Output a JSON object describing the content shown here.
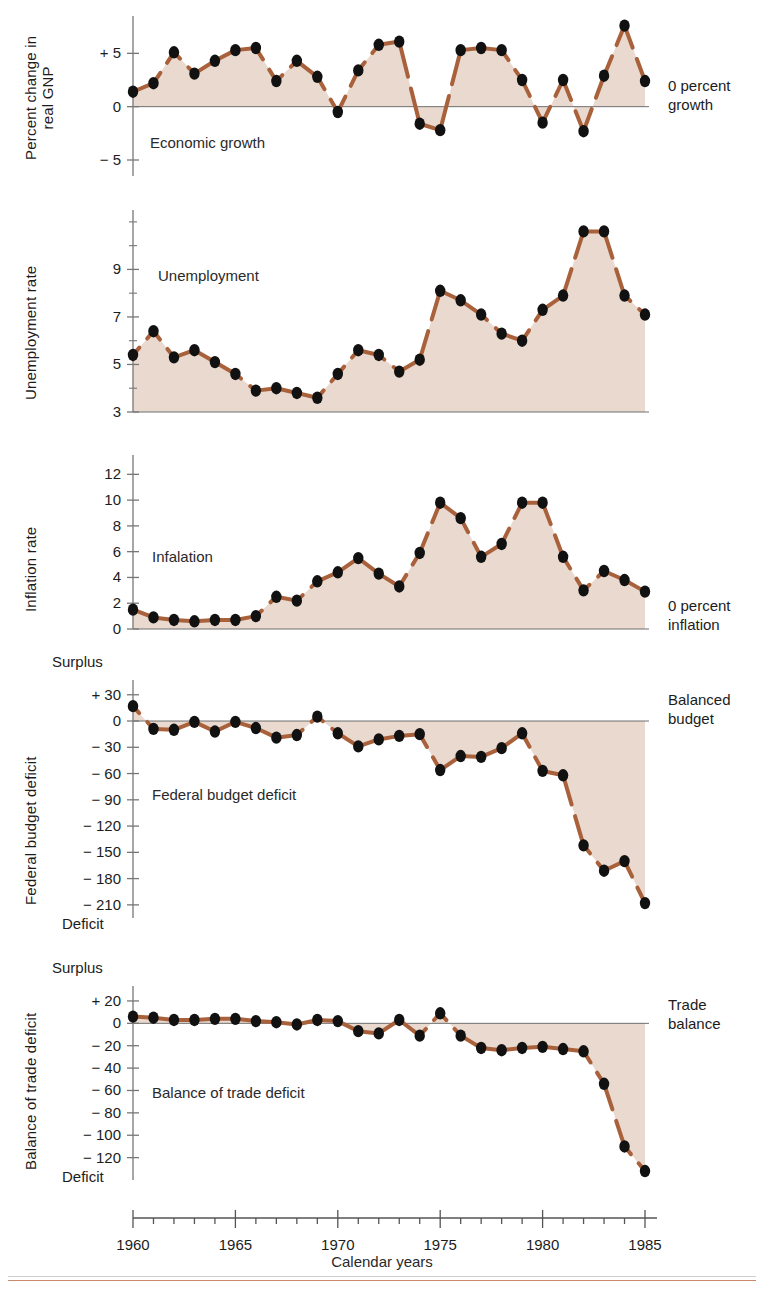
{
  "figure": {
    "x_axis_title": "Calendar years",
    "x_ticks": [
      1960,
      1965,
      1970,
      1975,
      1980,
      1985
    ],
    "x_min": 1960,
    "x_max": 1985,
    "series_color": "#a9613c",
    "fill_color": "#e8d7cb",
    "marker_color": "#111111",
    "axis_color": "#777777",
    "rule_color": "#c98a6b"
  },
  "chart_data": [
    {
      "type": "line",
      "name": "economic-growth",
      "title": "Economic growth",
      "ylabel": "Percent change in\nreal GNP",
      "xlabel": "",
      "annotation": "0 percent\ngrowth",
      "ylim": [
        -6.5,
        8.5
      ],
      "yticks": [
        -5,
        0,
        5
      ],
      "ytick_labels": [
        "− 5",
        "0",
        "+ 5"
      ],
      "grid": false,
      "baseline": 0,
      "x": [
        1960,
        1961,
        1962,
        1963,
        1964,
        1965,
        1966,
        1967,
        1968,
        1969,
        1970,
        1971,
        1972,
        1973,
        1974,
        1975,
        1976,
        1977,
        1978,
        1979,
        1980,
        1981,
        1982,
        1983,
        1984,
        1985
      ],
      "values": [
        1.4,
        2.2,
        5.1,
        3.1,
        4.3,
        5.3,
        5.5,
        2.4,
        4.3,
        2.8,
        -0.5,
        3.4,
        5.8,
        6.1,
        -1.6,
        -2.2,
        5.3,
        5.5,
        5.3,
        2.5,
        -1.5,
        2.5,
        -2.3,
        2.9,
        7.6,
        2.4
      ]
    },
    {
      "type": "line",
      "name": "unemployment",
      "title": "Unemployment",
      "ylabel": "Unemployment rate",
      "xlabel": "",
      "annotation": "",
      "ylim": [
        3,
        11.5
      ],
      "yticks": [
        3,
        5,
        7,
        9
      ],
      "ytick_labels": [
        "3",
        "5",
        "7",
        "9"
      ],
      "grid": false,
      "baseline": 3,
      "x": [
        1960,
        1961,
        1962,
        1963,
        1964,
        1965,
        1966,
        1967,
        1968,
        1969,
        1970,
        1971,
        1972,
        1973,
        1974,
        1975,
        1976,
        1977,
        1978,
        1979,
        1980,
        1981,
        1982,
        1983,
        1984,
        1985
      ],
      "values": [
        5.4,
        6.4,
        5.3,
        5.6,
        5.1,
        4.6,
        3.9,
        4.0,
        3.8,
        3.6,
        4.6,
        5.6,
        5.4,
        4.7,
        5.2,
        8.1,
        7.7,
        7.1,
        6.3,
        6.0,
        7.3,
        7.9,
        10.6,
        10.6,
        7.9,
        7.1
      ]
    },
    {
      "type": "line",
      "name": "inflation",
      "title": "Infalation",
      "ylabel": "Inflation rate",
      "xlabel": "",
      "annotation": "0 percent\ninflation",
      "ylim": [
        0,
        13.5
      ],
      "yticks": [
        0,
        2,
        4,
        6,
        8,
        10,
        12
      ],
      "ytick_labels": [
        "0",
        "2",
        "4",
        "6",
        "8",
        "10",
        "12"
      ],
      "grid": false,
      "baseline": 0,
      "x": [
        1960,
        1961,
        1962,
        1963,
        1964,
        1965,
        1966,
        1967,
        1968,
        1969,
        1970,
        1971,
        1972,
        1973,
        1974,
        1975,
        1976,
        1977,
        1978,
        1979,
        1980,
        1981,
        1982,
        1983,
        1984,
        1985
      ],
      "values": [
        1.5,
        0.9,
        0.7,
        0.6,
        0.7,
        0.7,
        1.0,
        2.5,
        2.2,
        3.7,
        4.4,
        5.5,
        4.3,
        3.3,
        5.9,
        9.8,
        8.6,
        5.6,
        6.6,
        9.8,
        9.8,
        5.6,
        3.0,
        4.5,
        3.8,
        2.9
      ]
    },
    {
      "type": "line",
      "name": "federal-budget-deficit",
      "title": "Federal budget deficit",
      "ylabel": "Federal budget deficit",
      "xlabel": "",
      "annotation": "Balanced\nbudget",
      "axis_top_label": "Surplus",
      "axis_bottom_label": "Deficit",
      "ylim": [
        -225,
        40
      ],
      "yticks": [
        30,
        0,
        -30,
        -60,
        -90,
        -120,
        -150,
        -180,
        -210
      ],
      "ytick_labels": [
        "+ 30",
        "0",
        "− 30",
        "− 60",
        "− 90",
        "− 120",
        "− 150",
        "− 180",
        "− 210"
      ],
      "grid": false,
      "baseline": 0,
      "x": [
        1960,
        1961,
        1962,
        1963,
        1964,
        1965,
        1966,
        1967,
        1968,
        1969,
        1970,
        1971,
        1972,
        1973,
        1974,
        1975,
        1976,
        1977,
        1978,
        1979,
        1980,
        1981,
        1982,
        1983,
        1984,
        1985
      ],
      "values": [
        17,
        -9,
        -10,
        -1,
        -12,
        -1,
        -8,
        -19,
        -16,
        5,
        -14,
        -29,
        -21,
        -17,
        -15,
        -56,
        -40,
        -41,
        -31,
        -14,
        -57,
        -62,
        -142,
        -171,
        -160,
        -208
      ]
    },
    {
      "type": "line",
      "name": "balance-of-trade-deficit",
      "title": "Balance of trade deficit",
      "ylabel": "Balance of trade deficit",
      "xlabel": "",
      "annotation": "Trade\nbalance",
      "axis_top_label": "Surplus",
      "axis_bottom_label": "Deficit",
      "ylim": [
        -140,
        28
      ],
      "yticks": [
        20,
        0,
        -20,
        -40,
        -60,
        -80,
        -100,
        -120
      ],
      "ytick_labels": [
        "+ 20",
        "0",
        "− 20",
        "− 40",
        "− 60",
        "− 80",
        "− 100",
        "− 120"
      ],
      "grid": false,
      "baseline": 0,
      "x": [
        1960,
        1961,
        1962,
        1963,
        1964,
        1965,
        1966,
        1967,
        1968,
        1969,
        1970,
        1971,
        1972,
        1973,
        1974,
        1975,
        1976,
        1977,
        1978,
        1979,
        1980,
        1981,
        1982,
        1983,
        1984,
        1985
      ],
      "values": [
        6,
        5,
        3,
        3,
        4,
        4,
        2,
        1,
        -1,
        3,
        2,
        -7,
        -9,
        3,
        -11,
        9,
        -11,
        -22,
        -24,
        -22,
        -21,
        -23,
        -25,
        -54,
        -110,
        -132
      ]
    }
  ]
}
